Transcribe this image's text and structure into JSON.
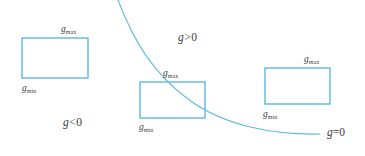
{
  "figure": {
    "width": 365,
    "height": 156,
    "background": "#ffffff",
    "stroke_color": "#5cb9e2",
    "text_color": "#3a3a3a"
  },
  "curve": {
    "name": "g=0",
    "label": "g",
    "relation": "=",
    "value": "0",
    "label_text": "g≠0",
    "color": "#5cb9e2",
    "path": "M 118,0 C 134,42 154,74 188,99 C 224,126 274,135 320,134",
    "start_point": [
      118,
      0
    ],
    "end_point": [
      320,
      134
    ]
  },
  "regions": [
    {
      "id": "positive",
      "var": "g",
      "op": ">",
      "value": "0",
      "x": 178,
      "y": 32
    },
    {
      "id": "negative",
      "var": "g",
      "op": "<",
      "value": "0",
      "x": 63,
      "y": 117
    }
  ],
  "curve_label": {
    "var": "g",
    "op": "=",
    "value": "0",
    "x": 327,
    "y": 127
  },
  "boxes": [
    {
      "id": "left-box",
      "x": 22,
      "y": 38,
      "width": 66,
      "height": 40,
      "max_label": {
        "var": "g",
        "sub": "max",
        "x": 61,
        "y": 25
      },
      "min_label": {
        "var": "g",
        "sub": "min",
        "x": 22,
        "y": 84
      }
    },
    {
      "id": "middle-box",
      "x": 140,
      "y": 82,
      "width": 65,
      "height": 36,
      "max_label": {
        "var": "g",
        "sub": "max",
        "x": 163,
        "y": 69
      },
      "min_label": {
        "var": "g",
        "sub": "min",
        "x": 139,
        "y": 123
      }
    },
    {
      "id": "right-box",
      "x": 265,
      "y": 68,
      "width": 65,
      "height": 36,
      "max_label": {
        "var": "g",
        "sub": "max",
        "x": 304,
        "y": 55
      },
      "min_label": {
        "var": "g",
        "sub": "min",
        "x": 263,
        "y": 110
      }
    }
  ]
}
